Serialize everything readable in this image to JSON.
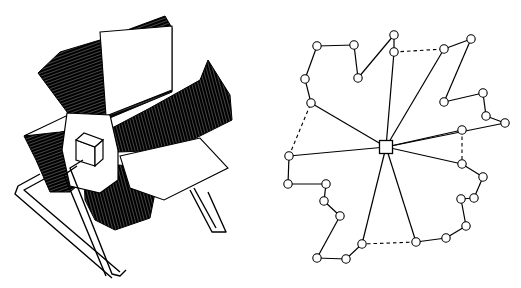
{
  "figure": {
    "left": {
      "name": "rotary-card-file-illustration",
      "stroke": "#000000",
      "fill": "#ffffff",
      "hub": {
        "cx": 100,
        "cy": 145
      },
      "fins": [
        {
          "id": "fin-top",
          "poly": "38,73 60,52 100,40 165,16 172,28 172,92 105,120 70,116"
        },
        {
          "id": "fin-right",
          "poly": "112,128 150,108 200,80 208,60 230,95 232,120 172,150 118,152"
        },
        {
          "id": "fin-left",
          "poly": "24,136 65,118 98,130 96,170 70,192 50,192 36,160"
        },
        {
          "id": "fin-bottom",
          "poly": "84,176 118,165 160,168 150,218 115,230 95,220 85,200"
        }
      ],
      "panels": [
        {
          "id": "panel-top-card",
          "poly": "100,32 172,26 172,90 106,116"
        },
        {
          "id": "panel-right-card",
          "poly": "120,156 200,138 228,168 164,200 130,188"
        },
        {
          "id": "panel-left-card",
          "poly": "24,136 66,116 98,126 60,132"
        }
      ],
      "hex_plate": "67,113 110,115 118,150 118,180 100,193 70,186 62,150",
      "knob": {
        "front": "76,140 95,147 95,166 76,160",
        "top": "76,140 84,133 103,140 95,147",
        "side": "95,147 103,140 103,159 95,166"
      },
      "stand": [
        "M83,160 L70,168 L112,274 L120,276 L126,270",
        "M77,166 L64,175 L106,276",
        "M40,174 L18,186 L15,194 L112,278",
        "M46,178 L24,190 L120,272",
        "M190,190 L212,232 L226,232 L208,192",
        "M194,188 L216,228"
      ]
    },
    "right": {
      "name": "network-graph",
      "node_radius": 4.2,
      "stroke": "#000000",
      "hub": {
        "x": 386,
        "y": 147,
        "size": 13
      },
      "nodes": [
        {
          "id": "n1",
          "x": 317,
          "y": 46
        },
        {
          "id": "n2",
          "x": 354,
          "y": 45
        },
        {
          "id": "n3",
          "x": 358,
          "y": 78
        },
        {
          "id": "n4",
          "x": 394,
          "y": 35
        },
        {
          "id": "n5",
          "x": 394,
          "y": 52
        },
        {
          "id": "n6",
          "x": 444,
          "y": 49
        },
        {
          "id": "n7",
          "x": 471,
          "y": 39
        },
        {
          "id": "n8",
          "x": 444,
          "y": 102
        },
        {
          "id": "n9",
          "x": 483,
          "y": 93
        },
        {
          "id": "n10",
          "x": 486,
          "y": 116
        },
        {
          "id": "n11",
          "x": 505,
          "y": 123
        },
        {
          "id": "n12",
          "x": 462,
          "y": 130
        },
        {
          "id": "n13",
          "x": 462,
          "y": 164
        },
        {
          "id": "n14",
          "x": 483,
          "y": 177
        },
        {
          "id": "n15",
          "x": 474,
          "y": 198
        },
        {
          "id": "n16",
          "x": 461,
          "y": 199
        },
        {
          "id": "n17",
          "x": 466,
          "y": 226
        },
        {
          "id": "n18",
          "x": 446,
          "y": 238
        },
        {
          "id": "n19",
          "x": 416,
          "y": 242
        },
        {
          "id": "n20",
          "x": 362,
          "y": 244
        },
        {
          "id": "n21",
          "x": 346,
          "y": 259
        },
        {
          "id": "n22",
          "x": 317,
          "y": 258
        },
        {
          "id": "n23",
          "x": 340,
          "y": 216
        },
        {
          "id": "n24",
          "x": 324,
          "y": 201
        },
        {
          "id": "n25",
          "x": 326,
          "y": 184
        },
        {
          "id": "n26",
          "x": 288,
          "y": 184
        },
        {
          "id": "n27",
          "x": 289,
          "y": 156
        },
        {
          "id": "n28",
          "x": 311,
          "y": 103
        },
        {
          "id": "n29",
          "x": 305,
          "y": 79
        }
      ],
      "solid_edges": [
        [
          "n1",
          "n2"
        ],
        [
          "n2",
          "n3"
        ],
        [
          "n3",
          "n4"
        ],
        [
          "n4",
          "n5"
        ],
        [
          "n6",
          "n7"
        ],
        [
          "n7",
          "n8"
        ],
        [
          "n8",
          "n9"
        ],
        [
          "n9",
          "n10"
        ],
        [
          "n10",
          "n11"
        ],
        [
          "n13",
          "n14"
        ],
        [
          "n14",
          "n15"
        ],
        [
          "n15",
          "n16"
        ],
        [
          "n16",
          "n17"
        ],
        [
          "n17",
          "n18"
        ],
        [
          "n18",
          "n19"
        ],
        [
          "n20",
          "n21"
        ],
        [
          "n21",
          "n22"
        ],
        [
          "n22",
          "n23"
        ],
        [
          "n23",
          "n24"
        ],
        [
          "n24",
          "n25"
        ],
        [
          "n25",
          "n26"
        ],
        [
          "n26",
          "n27"
        ],
        [
          "n28",
          "n29"
        ],
        [
          "n29",
          "n1"
        ]
      ],
      "dashed_edges": [
        [
          "n5",
          "n6"
        ],
        [
          "n12",
          "n13"
        ],
        [
          "n19",
          "n20"
        ],
        [
          "n27",
          "n28"
        ]
      ],
      "spokes": [
        "n5",
        "n6",
        "n11",
        "n12",
        "n13",
        "n19",
        "n20",
        "n27",
        "n28"
      ]
    }
  }
}
